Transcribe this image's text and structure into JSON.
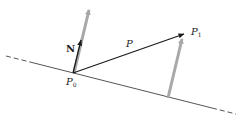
{
  "diagram": {
    "labels": {
      "normal": "N",
      "vector": "P",
      "point0": "P",
      "point0_sub": "0",
      "point1": "P",
      "point1_sub": "1"
    },
    "elements": [
      {
        "id": "plane-line",
        "type": "line",
        "style": "dashed-solid-dashed"
      },
      {
        "id": "normal-gray",
        "type": "arrow",
        "color": "#a8a8a8"
      },
      {
        "id": "normal-black",
        "type": "arrow",
        "label": "N",
        "color": "#1a1a1a"
      },
      {
        "id": "vector-p",
        "type": "arrow",
        "label": "P",
        "from": "P0",
        "to": "P1",
        "color": "#1a1a1a"
      },
      {
        "id": "projection-gray",
        "type": "arrow",
        "color": "#a8a8a8"
      }
    ],
    "colors": {
      "ink": "#1a1a1a",
      "gray_arrow": "#a8a8a8",
      "line": "#555555"
    }
  }
}
